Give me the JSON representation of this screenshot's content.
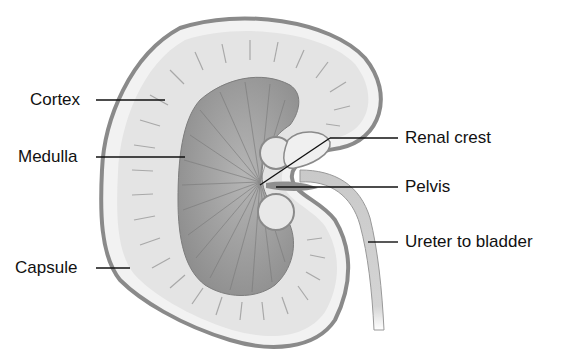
{
  "diagram": {
    "colors": {
      "capsule": "#8a8a8a",
      "cortex": "#e6e6e6",
      "cortex_light": "#f4f4f4",
      "medulla": "#9a9a9a",
      "pelvis": "#c8c8c8",
      "ureter": "#cfcfcf",
      "leader_line": "#111111",
      "text": "#111111"
    },
    "labels": {
      "left": [
        {
          "id": "cortex",
          "text": "Cortex"
        },
        {
          "id": "medulla",
          "text": "Medulla"
        },
        {
          "id": "capsule",
          "text": "Capsule"
        }
      ],
      "right": [
        {
          "id": "renal_crest",
          "text": "Renal crest"
        },
        {
          "id": "pelvis",
          "text": "Pelvis"
        },
        {
          "id": "ureter",
          "text": "Ureter to bladder"
        }
      ]
    }
  }
}
